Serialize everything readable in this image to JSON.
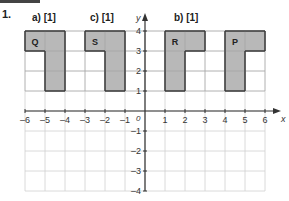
{
  "question": {
    "number": "1."
  },
  "parts": [
    {
      "label": "a) [1]",
      "x": 32,
      "y": 12
    },
    {
      "label": "c) [1]",
      "x": 90,
      "y": 12
    },
    {
      "label": "b) [1]",
      "x": 174,
      "y": 12
    }
  ],
  "axes": {
    "x_label": "x",
    "y_label": "y",
    "origin_label": "0",
    "x_ticks": [
      "-6",
      "-5",
      "-4",
      "-3",
      "-2",
      "-1",
      "1",
      "2",
      "3",
      "4",
      "5",
      "6"
    ],
    "y_ticks": [
      "4",
      "3",
      "2",
      "1",
      "-1",
      "-2",
      "-3",
      "-4"
    ],
    "x_range": [
      -6,
      6
    ],
    "y_range": [
      -4,
      4
    ]
  },
  "shapes": [
    {
      "name": "Q",
      "vertices": [
        [
          -6,
          4
        ],
        [
          -4,
          4
        ],
        [
          -4,
          1
        ],
        [
          -5,
          1
        ],
        [
          -5,
          3
        ],
        [
          -6,
          3
        ]
      ],
      "label_pos": [
        -5.5,
        3.5
      ]
    },
    {
      "name": "S",
      "vertices": [
        [
          -3,
          4
        ],
        [
          -1,
          4
        ],
        [
          -1,
          1
        ],
        [
          -2,
          1
        ],
        [
          -2,
          3
        ],
        [
          -3,
          3
        ]
      ],
      "label_pos": [
        -2.5,
        3.5
      ]
    },
    {
      "name": "R",
      "vertices": [
        [
          1,
          4
        ],
        [
          3,
          4
        ],
        [
          3,
          3
        ],
        [
          2,
          3
        ],
        [
          2,
          1
        ],
        [
          1,
          1
        ]
      ],
      "label_pos": [
        1.5,
        3.5
      ]
    },
    {
      "name": "P",
      "vertices": [
        [
          4,
          4
        ],
        [
          6,
          4
        ],
        [
          6,
          3
        ],
        [
          5,
          3
        ],
        [
          5,
          1
        ],
        [
          4,
          1
        ]
      ],
      "label_pos": [
        4.5,
        3.5
      ]
    }
  ],
  "colors": {
    "fill": "#b8b8b8",
    "stroke": "#333333",
    "grid": "#d0d0d0",
    "axis": "#333333"
  }
}
